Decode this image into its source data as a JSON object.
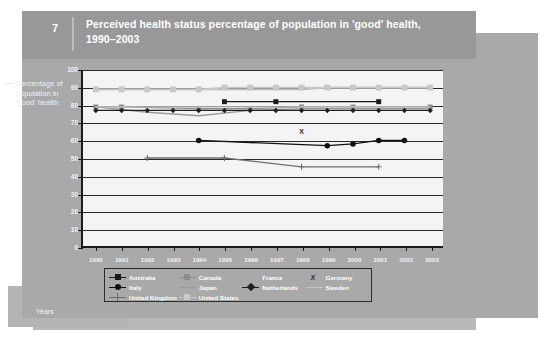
{
  "figure": {
    "number": "7",
    "title": "Perceived health status percentage of population in 'good' health, 1990–2003",
    "y_axis_caption": "Percentage of population in 'good' health",
    "x_axis_caption": "Years"
  },
  "colors": {
    "panel": "#a9a9a9",
    "header": "#989898",
    "plot_background": "#f4f4f4",
    "axis": "#1a1a1a",
    "text_light": "#ffffff",
    "australia": "#1a1a1a",
    "canada": "#8c8c8c",
    "france": "#bdbdbd",
    "germany": "#2a2a2a",
    "italy": "#111111",
    "japan": "#9a9a9a",
    "netherlands": "#1f1f1f",
    "sweden": "#c4c4c4",
    "united_kingdom": "#6e6e6e",
    "united_states": "#c8c8c8"
  },
  "legend": {
    "entries": [
      {
        "label": "Australia",
        "marker": "square",
        "color": "#1a1a1a",
        "line": true
      },
      {
        "label": "Canada",
        "marker": "square",
        "color": "#8c8c8c",
        "line": true
      },
      {
        "label": "France",
        "marker": "none",
        "color": "#bdbdbd",
        "line": false
      },
      {
        "label": "Germany",
        "marker": "x",
        "color": "#2a2a2a",
        "line": false
      },
      {
        "label": "Italy",
        "marker": "circle",
        "color": "#111111",
        "line": true
      },
      {
        "label": "Japan",
        "marker": "none",
        "color": "#9a9a9a",
        "line": true
      },
      {
        "label": "Netherlands",
        "marker": "diamond",
        "color": "#1f1f1f",
        "line": true
      },
      {
        "label": "Sweden",
        "marker": "none",
        "color": "#c4c4c4",
        "line": true
      },
      {
        "label": "United Kingdom",
        "marker": "plus",
        "color": "#6e6e6e",
        "line": true
      },
      {
        "label": "United States",
        "marker": "square",
        "color": "#c8c8c8",
        "line": true
      }
    ]
  },
  "chart_data": {
    "type": "line",
    "title": "Perceived health status percentage of population in 'good' health, 1990–2003",
    "xlabel": "Years",
    "ylabel": "Percentage of population in 'good' health",
    "ylim": [
      0,
      100
    ],
    "ytick_step": 10,
    "yticks": [
      0,
      10,
      20,
      30,
      40,
      50,
      60,
      70,
      80,
      90,
      100
    ],
    "grid": true,
    "legend_position": "bottom",
    "categories": [
      "1990",
      "1991",
      "1992",
      "1993",
      "1994",
      "1995",
      "1996",
      "1997",
      "1998",
      "1999",
      "2000",
      "2001",
      "2002",
      "2003"
    ],
    "series": [
      {
        "name": "Australia",
        "marker": "square",
        "color": "#1a1a1a",
        "x": [
          "1995",
          "1997",
          "2001"
        ],
        "values": [
          82,
          82,
          82
        ]
      },
      {
        "name": "Canada",
        "marker": "square",
        "color": "#8c8c8c",
        "x": [
          "1990",
          "1991",
          "1994",
          "1996",
          "1998",
          "2000",
          "2003"
        ],
        "values": [
          79,
          79,
          78,
          78,
          79,
          79,
          79
        ]
      },
      {
        "name": "France",
        "marker": "none",
        "color": "#bdbdbd",
        "x": [
          "1990",
          "1991",
          "1992",
          "1993",
          "1994",
          "1995",
          "1996",
          "1997",
          "1998",
          "1999",
          "2000",
          "2001",
          "2002",
          "2003"
        ],
        "values": [
          89,
          89,
          89,
          89,
          89,
          89,
          89,
          89,
          89,
          90,
          90,
          90,
          90,
          90
        ]
      },
      {
        "name": "Germany",
        "marker": "x",
        "color": "#2a2a2a",
        "x": [
          "1998"
        ],
        "values": [
          65
        ]
      },
      {
        "name": "Italy",
        "marker": "circle",
        "color": "#111111",
        "x": [
          "1994",
          "1999",
          "2000",
          "2001",
          "2002"
        ],
        "values": [
          60,
          57,
          58,
          60,
          60
        ]
      },
      {
        "name": "Japan",
        "marker": "none",
        "color": "#9a9a9a",
        "x": [
          "1990",
          "1992",
          "1994",
          "1996",
          "1998",
          "2000",
          "2002",
          "2003"
        ],
        "values": [
          79,
          76,
          74,
          77,
          78,
          78,
          78,
          78
        ]
      },
      {
        "name": "Netherlands",
        "marker": "diamond",
        "color": "#1f1f1f",
        "x": [
          "1990",
          "1991",
          "1992",
          "1993",
          "1994",
          "1995",
          "1996",
          "1997",
          "1998",
          "1999",
          "2000",
          "2001",
          "2002",
          "2003"
        ],
        "values": [
          77,
          77,
          77,
          77,
          77,
          77,
          77,
          77,
          77,
          77,
          77,
          77,
          77,
          77
        ]
      },
      {
        "name": "Sweden",
        "marker": "none",
        "color": "#c4c4c4",
        "x": [
          "1990",
          "1995",
          "2000",
          "2003"
        ],
        "values": [
          79,
          79,
          79,
          79
        ]
      },
      {
        "name": "United Kingdom",
        "marker": "plus",
        "color": "#6e6e6e",
        "x": [
          "1992",
          "1995",
          "1998",
          "2001"
        ],
        "values": [
          50,
          50,
          45,
          45
        ]
      },
      {
        "name": "United States",
        "marker": "square",
        "color": "#c8c8c8",
        "x": [
          "1990",
          "1991",
          "1992",
          "1993",
          "1994",
          "1995",
          "1996",
          "1997",
          "1998",
          "1999",
          "2000",
          "2001",
          "2002",
          "2003"
        ],
        "values": [
          89,
          89,
          89,
          89,
          89,
          90,
          90,
          90,
          90,
          90,
          90,
          90,
          90,
          90
        ]
      }
    ]
  }
}
